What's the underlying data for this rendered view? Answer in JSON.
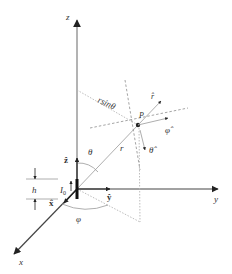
{
  "diagram": {
    "axes": {
      "x_label": "x",
      "y_label": "y",
      "z_label": "z"
    },
    "unit_vectors": {
      "x_hat": "x̂",
      "y_hat": "ŷ",
      "z_hat": "ẑ",
      "r_hat": "r̂",
      "theta_hat": "θ̂",
      "phi_hat": "φ̂"
    },
    "labels": {
      "point": "P",
      "radius": "r",
      "rsin": "rsinθ",
      "theta": "θ",
      "phi": "φ",
      "height": "h",
      "current": "I",
      "current_sub": "0"
    },
    "colors": {
      "axis": "#8a8a8a",
      "dark": "#222222",
      "dashed": "#9a9a9a"
    }
  }
}
